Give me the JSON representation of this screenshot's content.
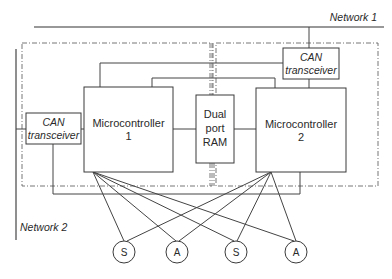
{
  "networks": {
    "network1": "Network 1",
    "network2": "Network 2"
  },
  "can_transceiver_1": {
    "line1": "CAN",
    "line2": "transceiver"
  },
  "can_transceiver_2": {
    "line1": "CAN",
    "line2": "transceiver"
  },
  "microcontroller_1": {
    "line1": "Microcontroller",
    "line2": "1"
  },
  "microcontroller_2": {
    "line1": "Microcontroller",
    "line2": "2"
  },
  "dual_port_ram": {
    "line1": "Dual",
    "line2": "port",
    "line3": "RAM"
  },
  "devices": [
    {
      "label": "S",
      "type": "sensor"
    },
    {
      "label": "A",
      "type": "actuator"
    },
    {
      "label": "S",
      "type": "sensor"
    },
    {
      "label": "A",
      "type": "actuator"
    }
  ]
}
